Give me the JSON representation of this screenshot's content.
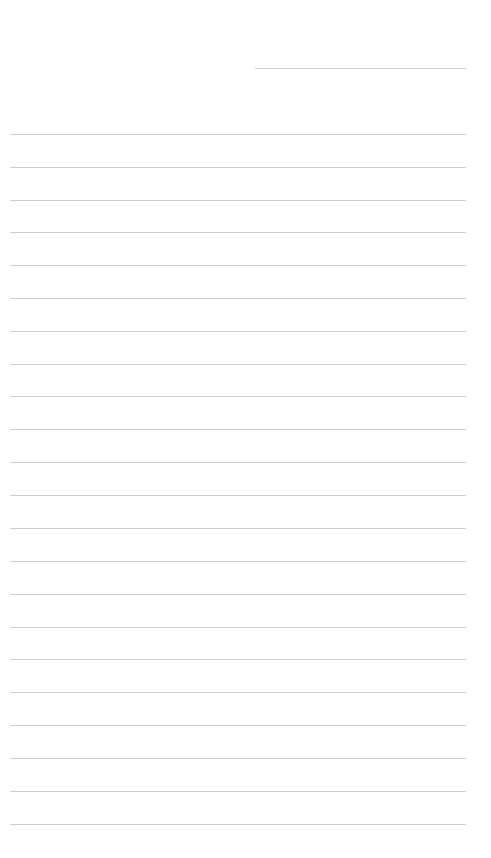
{
  "page": {
    "type": "ruled-notepad",
    "background_color": "#ffffff",
    "rule_color": "#cfcfcf",
    "header_line": {
      "label": "",
      "x_start": 255,
      "x_end": 466,
      "y": 68
    },
    "lines": {
      "x_start": 10,
      "x_end": 466,
      "y_positions": [
        134,
        167,
        200,
        232,
        265,
        298,
        331,
        364,
        396,
        429,
        462,
        495,
        528,
        561,
        594,
        627,
        659,
        692,
        725,
        758,
        791,
        824
      ],
      "text": [
        "",
        "",
        "",
        "",
        "",
        "",
        "",
        "",
        "",
        "",
        "",
        "",
        "",
        "",
        "",
        "",
        "",
        "",
        "",
        "",
        "",
        ""
      ]
    }
  }
}
